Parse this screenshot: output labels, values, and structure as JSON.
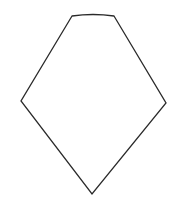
{
  "figure": {
    "width": 179,
    "height": 209,
    "background": "#ffffff",
    "shape": {
      "type": "pentagon-kite",
      "stroke": "#2a2a2a",
      "stroke_width": 1.3,
      "fill": "#ffffff",
      "vertices": {
        "top_left": [
          72,
          16
        ],
        "top_right": [
          114,
          16
        ],
        "right": [
          166,
          103
        ],
        "bottom": [
          92,
          194
        ],
        "left": [
          21,
          101
        ]
      },
      "top_edge_curve_control": [
        93,
        13
      ]
    }
  }
}
